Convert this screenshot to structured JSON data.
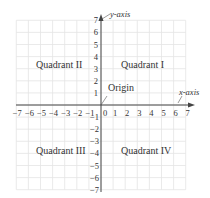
{
  "diagram": {
    "x_axis_label": "x-axis",
    "y_axis_label": "y-axis",
    "origin_label": "Origin",
    "quadrants": {
      "q1": "Quadrant I",
      "q2": "Quadrant II",
      "q3": "Quadrant III",
      "q4": "Quadrant IV"
    },
    "x_ticks": [
      "-7",
      "-6",
      "-5",
      "-4",
      "-3",
      "-2",
      "-1",
      "0",
      "1",
      "2",
      "3",
      "4",
      "5",
      "6",
      "7"
    ],
    "y_ticks_pos": [
      "1",
      "2",
      "3",
      "4",
      "5",
      "6",
      "7"
    ],
    "y_ticks_neg": [
      "-1",
      "-2",
      "-3",
      "-4",
      "-5",
      "-6",
      "-7"
    ],
    "range": {
      "xmin": -7,
      "xmax": 7,
      "ymin": -7,
      "ymax": 7
    },
    "colors": {
      "grid": "#e4e4e4",
      "axis": "#444444",
      "text": "#333333"
    }
  }
}
